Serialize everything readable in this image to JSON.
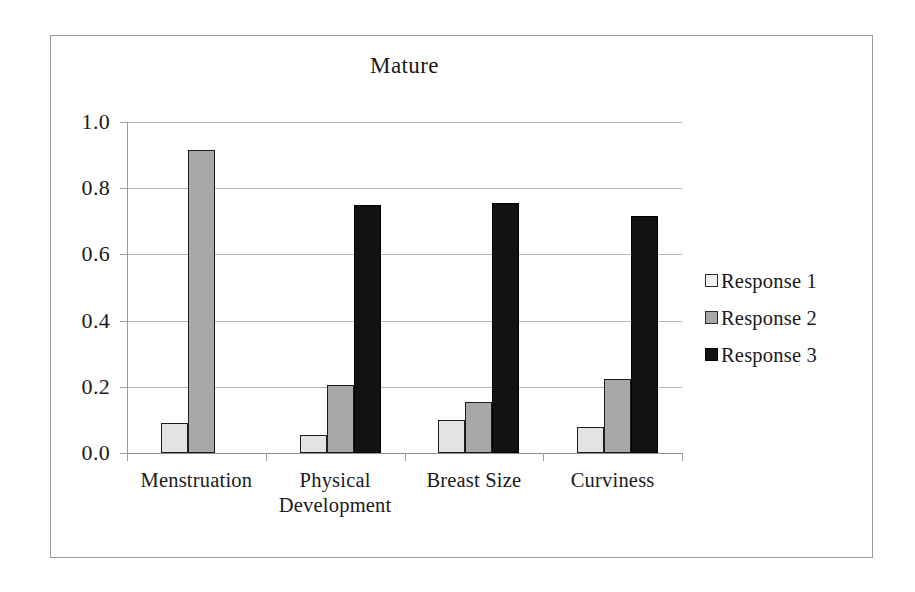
{
  "chart_data": {
    "type": "bar",
    "title": "Mature",
    "xlabel": "",
    "ylabel": "",
    "ylim": [
      0.0,
      1.0
    ],
    "ytick_labels": [
      "1.0",
      "0.8",
      "0.6",
      "0.4",
      "0.2",
      "0.0"
    ],
    "ytick_values": [
      1.0,
      0.8,
      0.6,
      0.4,
      0.2,
      0.0
    ],
    "grid": "horizontal",
    "legend_position": "right",
    "categories": [
      "Menstruation",
      "Physical Development",
      "Breast Size",
      "Curviness"
    ],
    "category_lines": [
      [
        "Menstruation"
      ],
      [
        "Physical",
        "Development"
      ],
      [
        "Breast Size"
      ],
      [
        "Curviness"
      ]
    ],
    "series": [
      {
        "name": "Response 1",
        "color": "#e3e3e3",
        "values": [
          0.09,
          0.055,
          0.1,
          0.08
        ]
      },
      {
        "name": "Response 2",
        "color": "#a8a8a8",
        "values": [
          0.915,
          0.205,
          0.155,
          0.225
        ]
      },
      {
        "name": "Response 3",
        "color": "#121212",
        "values": [
          0.0,
          0.75,
          0.755,
          0.715
        ]
      }
    ]
  },
  "legend": {
    "entries": [
      {
        "label": "Response 1"
      },
      {
        "label": "Response 2"
      },
      {
        "label": "Response 3"
      }
    ]
  },
  "colors": {
    "series_1": "#e3e3e3",
    "series_2": "#a8a8a8",
    "series_3": "#121212",
    "gridline": "#b4b4b4",
    "axis": "#9d9d9d",
    "frame": "#9a9a9a",
    "text": "#1a1a1a",
    "background": "#ffffff"
  }
}
